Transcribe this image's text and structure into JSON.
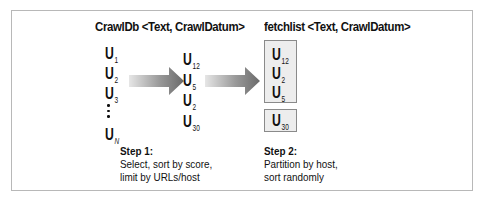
{
  "diagram": {
    "crawldb": {
      "title": "CrawlDb <Text, CrawlDatum>",
      "items": [
        {
          "base": "U",
          "sub": "1"
        },
        {
          "base": "U",
          "sub": "2"
        },
        {
          "base": "U",
          "sub": "3"
        },
        {
          "base": "U",
          "sub": "N"
        }
      ],
      "ellipsis": "vertical-dots"
    },
    "selected": {
      "items": [
        {
          "base": "U",
          "sub": "12"
        },
        {
          "base": "U",
          "sub": "5"
        },
        {
          "base": "U",
          "sub": "2"
        },
        {
          "base": "U",
          "sub": "30"
        }
      ]
    },
    "fetchlist": {
      "title": "fetchlist <Text, CrawlDatum>",
      "partitions": [
        {
          "items": [
            {
              "base": "U",
              "sub": "12"
            },
            {
              "base": "U",
              "sub": "2"
            },
            {
              "base": "U",
              "sub": "5"
            }
          ]
        },
        {
          "items": [
            {
              "base": "U",
              "sub": "30"
            }
          ]
        }
      ]
    },
    "steps": [
      {
        "heading": "Step 1:",
        "lines": [
          "Select, sort by score,",
          "limit by URLs/host"
        ]
      },
      {
        "heading": "Step 2:",
        "lines": [
          "Partition by host,",
          "sort randomly"
        ]
      }
    ],
    "arrows": [
      {
        "name": "step1-arrow",
        "direction": "right",
        "style": "gray-gradient"
      },
      {
        "name": "step2-arrow",
        "direction": "right",
        "style": "gray-gradient"
      }
    ],
    "colors": {
      "frame_border": "#b8b8b8",
      "box_fill": "#ededed",
      "box_border": "#8a8a8a",
      "arrow_dark": "#6e6e6e",
      "arrow_light": "#e2e2e2",
      "text": "#111111"
    }
  }
}
